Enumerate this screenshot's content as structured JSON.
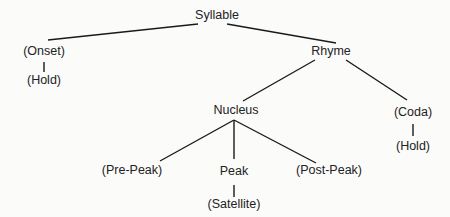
{
  "diagram": {
    "type": "syllable-structure-tree",
    "colors": {
      "background": "#fbfbfa",
      "text": "#222222",
      "line": "#1a1a1a"
    },
    "nodes": {
      "syllable": "Syllable",
      "onset": "(Onset)",
      "onset_hold": "(Hold)",
      "rhyme": "Rhyme",
      "nucleus": "Nucleus",
      "coda": "(Coda)",
      "coda_hold": "(Hold)",
      "pre_peak": "(Pre-Peak)",
      "peak": "Peak",
      "post_peak": "(Post-Peak)",
      "satellite": "(Satellite)"
    },
    "edges": [
      [
        "Syllable",
        "(Onset)"
      ],
      [
        "Syllable",
        "Rhyme"
      ],
      [
        "(Onset)",
        "(Hold)"
      ],
      [
        "Rhyme",
        "Nucleus"
      ],
      [
        "Rhyme",
        "(Coda)"
      ],
      [
        "(Coda)",
        "(Hold)"
      ],
      [
        "Nucleus",
        "(Pre-Peak)"
      ],
      [
        "Nucleus",
        "Peak"
      ],
      [
        "Nucleus",
        "(Post-Peak)"
      ],
      [
        "Peak",
        "(Satellite)"
      ]
    ]
  }
}
